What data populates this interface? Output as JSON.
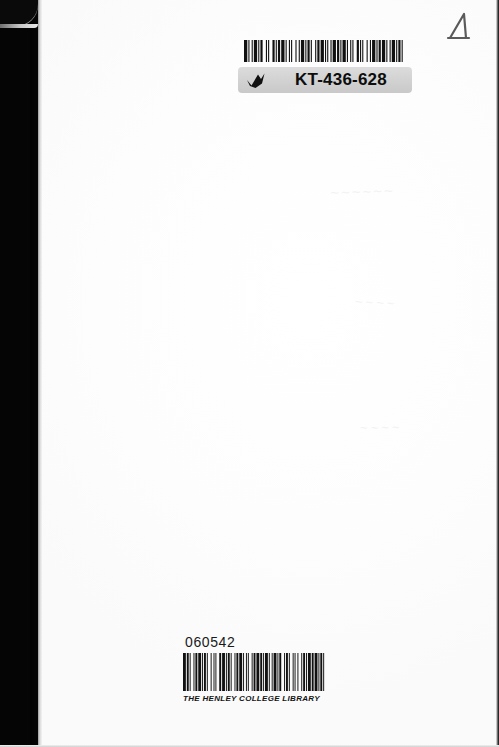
{
  "document": {
    "type": "book-cover-scan",
    "description": "Scanned blank back cover of a book with library labels",
    "background_color": "#fdfdfd"
  },
  "spine": {
    "name": "left-dark-scan-band",
    "color": "#050505",
    "width_px": 38
  },
  "handwritten_mark": {
    "glyph": "triangle-mark",
    "color": "#555555"
  },
  "top_label": {
    "name": "kt-barcode-label",
    "barcode_alt": "barcode",
    "code": "KT-436-628",
    "tick_icon": "tick-icon",
    "band_color": "#d2d2d2",
    "barcode_pattern": [
      3,
      1,
      1,
      2,
      1,
      1,
      3,
      1,
      1,
      1,
      2,
      3,
      1,
      1,
      1,
      3,
      2,
      1,
      1,
      1,
      2,
      1,
      3,
      1,
      1,
      2,
      1,
      1,
      1,
      3,
      1,
      2,
      1,
      1,
      3,
      1,
      1,
      1,
      2,
      1,
      1,
      3,
      1,
      1,
      2,
      1,
      3,
      1,
      1,
      1,
      1,
      2,
      1,
      1,
      3,
      1,
      2,
      1,
      1,
      1,
      3,
      1,
      1,
      2,
      1,
      1,
      1,
      3,
      2,
      1,
      1,
      1,
      1,
      3,
      1,
      2,
      1,
      1,
      3,
      1,
      1,
      1,
      2,
      1,
      3,
      1,
      1,
      2,
      1,
      1,
      3,
      1,
      1,
      1,
      2,
      1,
      1,
      3
    ]
  },
  "bottom_label": {
    "name": "henley-college-library-label",
    "accession_number": "060542",
    "library_name": "THE HENLEY COLLEGE LIBRARY",
    "barcode_alt": "barcode",
    "barcode_pattern": [
      3,
      1,
      2,
      1,
      1,
      3,
      1,
      1,
      2,
      1,
      3,
      1,
      1,
      1,
      2,
      1,
      1,
      3,
      1,
      2,
      1,
      1,
      1,
      3,
      2,
      1,
      3,
      1,
      1,
      1,
      2,
      1,
      1,
      3,
      1,
      1,
      2,
      1,
      3,
      1,
      1,
      2,
      1,
      1,
      1,
      3,
      1,
      1,
      2,
      1,
      3,
      1,
      2,
      1,
      1,
      1,
      3,
      1,
      1,
      2,
      1,
      1,
      3,
      1,
      1,
      1,
      2,
      3,
      1,
      1,
      2,
      1,
      1,
      3,
      1,
      1,
      1,
      2,
      1,
      3,
      1,
      1,
      2,
      1,
      1,
      1,
      3,
      1,
      2,
      1,
      3,
      1,
      1,
      1,
      2,
      1,
      1,
      3
    ]
  },
  "smudges": {
    "a": "~~~~~~",
    "b": "~~~~",
    "c": "~~~~"
  }
}
